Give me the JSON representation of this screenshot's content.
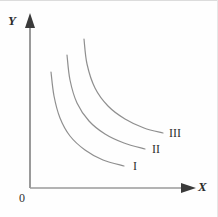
{
  "figure": {
    "kind": "indifference-curve-diagram",
    "background_color": "#ffffff",
    "axis_color": "#9a9a9a",
    "curve_color": "#8f8f8f",
    "text_color": "#2f2f2f"
  },
  "axes": {
    "y_label": "Y",
    "x_label": "X",
    "origin_label": "0",
    "origin_px": {
      "x": 30,
      "y": 188
    },
    "y_axis_top_px": {
      "x": 30,
      "y": 18
    },
    "x_axis_right_px": {
      "x": 192,
      "y": 188
    },
    "arrowheads": {
      "y": "up",
      "x": "right"
    }
  },
  "chart_data": {
    "type": "line",
    "title": "",
    "xlabel": "X",
    "ylabel": "Y",
    "grid": false,
    "legend": "inline-end-of-curve",
    "xlim": [
      0,
      192
    ],
    "ylim": [
      0,
      188
    ],
    "series": [
      {
        "name": "I",
        "label": "I",
        "label_position_px": {
          "x": 133,
          "y": 160
        },
        "points_px": [
          {
            "x": 51,
            "y": 72
          },
          {
            "x": 54,
            "y": 96
          },
          {
            "x": 60,
            "y": 118
          },
          {
            "x": 70,
            "y": 136
          },
          {
            "x": 85,
            "y": 150
          },
          {
            "x": 103,
            "y": 160
          },
          {
            "x": 124,
            "y": 166
          }
        ]
      },
      {
        "name": "II",
        "label": "II",
        "label_position_px": {
          "x": 152,
          "y": 143
        },
        "points_px": [
          {
            "x": 67,
            "y": 55
          },
          {
            "x": 70,
            "y": 80
          },
          {
            "x": 77,
            "y": 103
          },
          {
            "x": 89,
            "y": 121
          },
          {
            "x": 105,
            "y": 134
          },
          {
            "x": 124,
            "y": 143
          },
          {
            "x": 145,
            "y": 149
          }
        ]
      },
      {
        "name": "III",
        "label": "III",
        "label_position_px": {
          "x": 169,
          "y": 127
        },
        "points_px": [
          {
            "x": 84,
            "y": 39
          },
          {
            "x": 87,
            "y": 64
          },
          {
            "x": 95,
            "y": 88
          },
          {
            "x": 108,
            "y": 106
          },
          {
            "x": 125,
            "y": 119
          },
          {
            "x": 144,
            "y": 128
          },
          {
            "x": 163,
            "y": 133
          }
        ]
      }
    ]
  }
}
